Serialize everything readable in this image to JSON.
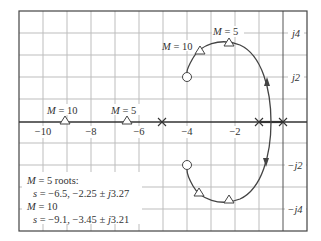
{
  "diagram": {
    "type": "root-locus",
    "x_axis": {
      "range": [
        -11,
        1
      ],
      "tick_labels": [
        "−10",
        "−8",
        "−6",
        "−4",
        "−2"
      ],
      "tick_values": [
        -10,
        -8,
        -6,
        -4,
        -2
      ]
    },
    "y_axis": {
      "range": [
        -5,
        5
      ],
      "tick_labels": [
        "j4",
        "j2",
        "−j2",
        "−j4"
      ],
      "tick_values": [
        4,
        2,
        -2,
        -4
      ]
    },
    "poles": [
      {
        "re": -5,
        "im": 0
      },
      {
        "re": -1,
        "im": 0
      },
      {
        "re": 0,
        "im": 0
      }
    ],
    "zeros": [
      {
        "re": -4,
        "im": 2
      },
      {
        "re": -4,
        "im": -2
      }
    ],
    "markers": {
      "upper_m10_label": "M = 10",
      "upper_m5_label": "M = 5",
      "real_m10_label": "M = 10",
      "real_m5_label": "M = 5"
    },
    "annotation": {
      "line1": "M = 5 roots:",
      "line2": "s = −6.5, −2.25 ± j3.27",
      "line3": "M = 10",
      "line4": "s = −9.1, −3.45 ± j3.21"
    },
    "roots": {
      "M5": [
        {
          "re": -6.5,
          "im": 0
        },
        {
          "re": -2.25,
          "im": 3.27
        },
        {
          "re": -2.25,
          "im": -3.27
        }
      ],
      "M10": [
        {
          "re": -9.1,
          "im": 0
        },
        {
          "re": -3.45,
          "im": 3.21
        },
        {
          "re": -3.45,
          "im": -3.21
        }
      ]
    },
    "colors": {
      "grid": "#b8b8b8",
      "axis": "#333333",
      "locus": "#444444"
    }
  }
}
